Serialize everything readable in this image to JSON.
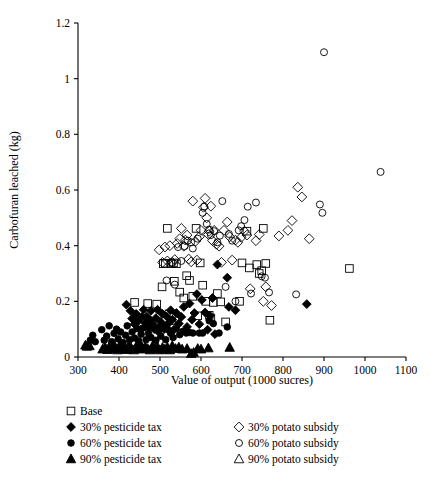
{
  "chart_data": {
    "type": "scatter",
    "title": "",
    "xlabel": "Value of output (1000 sucres)",
    "ylabel": "Carbofuran leached (kg)",
    "xlim": [
      300,
      1100
    ],
    "ylim": [
      0,
      1.2
    ],
    "xticks": [
      300,
      400,
      500,
      600,
      700,
      800,
      900,
      1000,
      1100
    ],
    "yticks": [
      0,
      0.2,
      0.4,
      0.6,
      0.8,
      1,
      1.2
    ],
    "xtick_labels": [
      "300",
      "400",
      "500",
      "600",
      "700",
      "800",
      "900",
      "1000",
      "1100"
    ],
    "ytick_labels": [
      "0",
      "0.2",
      "0.4",
      "0.6",
      "0.8",
      "1",
      "1.2"
    ],
    "grid": false,
    "legend_position": "below-axes",
    "series": [
      {
        "name": "Base",
        "marker": "open-square",
        "filled": false,
        "color": "#000000",
        "points": [
          [
            438,
            0.196
          ],
          [
            470,
            0.192
          ],
          [
            492,
            0.19
          ],
          [
            505,
            0.252
          ],
          [
            508,
            0.335
          ],
          [
            513,
            0.337
          ],
          [
            518,
            0.462
          ],
          [
            527,
            0.335
          ],
          [
            522,
            0.155
          ],
          [
            528,
            0.13
          ],
          [
            533,
            0.338
          ],
          [
            535,
            0.272
          ],
          [
            540,
            0.335
          ],
          [
            548,
            0.233
          ],
          [
            558,
            0.212
          ],
          [
            565,
            0.292
          ],
          [
            572,
            0.275
          ],
          [
            580,
            0.218
          ],
          [
            588,
            0.462
          ],
          [
            592,
            0.148
          ],
          [
            598,
            0.338
          ],
          [
            604,
            0.258
          ],
          [
            612,
            0.2
          ],
          [
            620,
            0.15
          ],
          [
            624,
            0.14
          ],
          [
            630,
            0.196
          ],
          [
            640,
            0.228
          ],
          [
            648,
            0.198
          ],
          [
            660,
            0.126
          ],
          [
            694,
            0.2
          ],
          [
            700,
            0.338
          ],
          [
            712,
            0.452
          ],
          [
            718,
            0.32
          ],
          [
            736,
            0.332
          ],
          [
            742,
            0.3
          ],
          [
            748,
            0.31
          ],
          [
            752,
            0.462
          ],
          [
            758,
            0.336
          ],
          [
            768,
            0.132
          ],
          [
            962,
            0.318
          ]
        ]
      },
      {
        "name": "30% pesticide tax",
        "marker": "filled-diamond",
        "filled": true,
        "color": "#000000",
        "points": [
          [
            418,
            0.188
          ],
          [
            428,
            0.166
          ],
          [
            432,
            0.138
          ],
          [
            438,
            0.118
          ],
          [
            442,
            0.155
          ],
          [
            446,
            0.128
          ],
          [
            452,
            0.098
          ],
          [
            456,
            0.144
          ],
          [
            460,
            0.17
          ],
          [
            464,
            0.122
          ],
          [
            468,
            0.145
          ],
          [
            472,
            0.108
          ],
          [
            476,
            0.132
          ],
          [
            478,
            0.166
          ],
          [
            482,
            0.118
          ],
          [
            486,
            0.1
          ],
          [
            490,
            0.14
          ],
          [
            494,
            0.17
          ],
          [
            498,
            0.108
          ],
          [
            502,
            0.126
          ],
          [
            506,
            0.155
          ],
          [
            510,
            0.1
          ],
          [
            516,
            0.146
          ],
          [
            520,
            0.12
          ],
          [
            526,
            0.168
          ],
          [
            530,
            0.134
          ],
          [
            534,
            0.098
          ],
          [
            540,
            0.158
          ],
          [
            546,
            0.12
          ],
          [
            552,
            0.144
          ],
          [
            558,
            0.18
          ],
          [
            566,
            0.108
          ],
          [
            572,
            0.192
          ],
          [
            578,
            0.134
          ],
          [
            584,
            0.158
          ],
          [
            590,
            0.226
          ],
          [
            596,
            0.118
          ],
          [
            602,
            0.205
          ],
          [
            610,
            0.16
          ],
          [
            616,
            0.098
          ],
          [
            622,
            0.148
          ],
          [
            628,
            0.212
          ],
          [
            634,
            0.082
          ],
          [
            640,
            0.332
          ],
          [
            664,
            0.285
          ],
          [
            668,
            0.18
          ],
          [
            684,
            0.168
          ],
          [
            858,
            0.19
          ]
        ]
      },
      {
        "name": "60% pesticide tax",
        "marker": "filled-circle",
        "filled": true,
        "color": "#000000",
        "points": [
          [
            330,
            0.06
          ],
          [
            336,
            0.078
          ],
          [
            342,
            0.055
          ],
          [
            358,
            0.098
          ],
          [
            364,
            0.06
          ],
          [
            370,
            0.075
          ],
          [
            376,
            0.112
          ],
          [
            382,
            0.055
          ],
          [
            388,
            0.085
          ],
          [
            394,
            0.1
          ],
          [
            398,
            0.065
          ],
          [
            404,
            0.09
          ],
          [
            410,
            0.052
          ],
          [
            416,
            0.078
          ],
          [
            420,
            0.112
          ],
          [
            426,
            0.062
          ],
          [
            432,
            0.09
          ],
          [
            438,
            0.068
          ],
          [
            444,
            0.102
          ],
          [
            448,
            0.058
          ],
          [
            454,
            0.082
          ],
          [
            460,
            0.105
          ],
          [
            466,
            0.062
          ],
          [
            472,
            0.085
          ],
          [
            478,
            0.07
          ],
          [
            484,
            0.105
          ],
          [
            490,
            0.06
          ],
          [
            496,
            0.092
          ],
          [
            502,
            0.075
          ],
          [
            508,
            0.112
          ],
          [
            514,
            0.062
          ],
          [
            520,
            0.098
          ],
          [
            526,
            0.085
          ],
          [
            532,
            0.07
          ],
          [
            540,
            0.102
          ],
          [
            548,
            0.08
          ],
          [
            556,
            0.092
          ],
          [
            564,
            0.086
          ],
          [
            572,
            0.088
          ],
          [
            580,
            0.086
          ],
          [
            596,
            0.086
          ],
          [
            604,
            0.086
          ],
          [
            620,
            0.13
          ],
          [
            630,
            0.12
          ],
          [
            644,
            0.086
          ],
          [
            664,
            0.108
          ]
        ]
      },
      {
        "name": "90% pesticide tax",
        "marker": "filled-triangle",
        "filled": true,
        "color": "#000000",
        "points": [
          [
            318,
            0.042
          ],
          [
            322,
            0.038
          ],
          [
            328,
            0.04
          ],
          [
            360,
            0.028
          ],
          [
            366,
            0.035
          ],
          [
            372,
            0.026
          ],
          [
            378,
            0.04
          ],
          [
            384,
            0.03
          ],
          [
            390,
            0.038
          ],
          [
            396,
            0.025
          ],
          [
            402,
            0.042
          ],
          [
            408,
            0.03
          ],
          [
            412,
            0.038
          ],
          [
            418,
            0.026
          ],
          [
            424,
            0.04
          ],
          [
            430,
            0.032
          ],
          [
            436,
            0.025
          ],
          [
            442,
            0.038
          ],
          [
            448,
            0.03
          ],
          [
            454,
            0.042
          ],
          [
            458,
            0.028
          ],
          [
            464,
            0.036
          ],
          [
            470,
            0.03
          ],
          [
            476,
            0.025
          ],
          [
            482,
            0.04
          ],
          [
            488,
            0.03
          ],
          [
            494,
            0.036
          ],
          [
            500,
            0.025
          ],
          [
            506,
            0.034
          ],
          [
            512,
            0.028
          ],
          [
            518,
            0.035
          ],
          [
            524,
            0.025
          ],
          [
            530,
            0.04
          ],
          [
            538,
            0.03
          ],
          [
            546,
            0.035
          ],
          [
            554,
            0.028
          ],
          [
            566,
            0.03
          ],
          [
            576,
            0.012
          ],
          [
            582,
            0.016
          ],
          [
            592,
            0.03
          ],
          [
            600,
            0.028
          ],
          [
            618,
            0.032
          ],
          [
            670,
            0.034
          ]
        ]
      },
      {
        "name": "30% potato subsidy",
        "marker": "open-diamond",
        "filled": false,
        "color": "#000000",
        "points": [
          [
            498,
            0.385
          ],
          [
            506,
            0.34
          ],
          [
            512,
            0.395
          ],
          [
            518,
            0.345
          ],
          [
            524,
            0.4
          ],
          [
            530,
            0.34
          ],
          [
            536,
            0.35
          ],
          [
            542,
            0.408
          ],
          [
            548,
            0.425
          ],
          [
            552,
            0.462
          ],
          [
            558,
            0.398
          ],
          [
            562,
            0.42
          ],
          [
            566,
            0.438
          ],
          [
            570,
            0.352
          ],
          [
            576,
            0.342
          ],
          [
            580,
            0.56
          ],
          [
            586,
            0.415
          ],
          [
            590,
            0.348
          ],
          [
            596,
            0.432
          ],
          [
            600,
            0.455
          ],
          [
            606,
            0.538
          ],
          [
            610,
            0.57
          ],
          [
            614,
            0.5
          ],
          [
            618,
            0.44
          ],
          [
            620,
            0.452
          ],
          [
            624,
            0.542
          ],
          [
            628,
            0.418
          ],
          [
            632,
            0.455
          ],
          [
            638,
            0.405
          ],
          [
            644,
            0.398
          ],
          [
            650,
            0.34
          ],
          [
            656,
            0.455
          ],
          [
            664,
            0.485
          ],
          [
            670,
            0.432
          ],
          [
            676,
            0.348
          ],
          [
            684,
            0.42
          ],
          [
            690,
            0.412
          ],
          [
            698,
            0.43
          ],
          [
            706,
            0.452
          ],
          [
            712,
            0.438
          ],
          [
            720,
            0.245
          ],
          [
            734,
            0.418
          ],
          [
            742,
            0.44
          ],
          [
            752,
            0.2
          ],
          [
            758,
            0.252
          ],
          [
            772,
            0.185
          ],
          [
            790,
            0.435
          ],
          [
            812,
            0.455
          ],
          [
            822,
            0.49
          ],
          [
            836,
            0.61
          ],
          [
            846,
            0.575
          ],
          [
            864,
            0.425
          ]
        ]
      },
      {
        "name": "60% potato subsidy",
        "marker": "open-circle",
        "filled": false,
        "color": "#000000",
        "points": [
          [
            516,
            0.275
          ],
          [
            528,
            0.34
          ],
          [
            536,
            0.26
          ],
          [
            544,
            0.395
          ],
          [
            552,
            0.345
          ],
          [
            560,
            0.398
          ],
          [
            568,
            0.418
          ],
          [
            576,
            0.412
          ],
          [
            580,
            0.39
          ],
          [
            592,
            0.425
          ],
          [
            604,
            0.518
          ],
          [
            608,
            0.54
          ],
          [
            614,
            0.478
          ],
          [
            620,
            0.458
          ],
          [
            624,
            0.438
          ],
          [
            632,
            0.452
          ],
          [
            640,
            0.412
          ],
          [
            646,
            0.436
          ],
          [
            652,
            0.56
          ],
          [
            660,
            0.252
          ],
          [
            668,
            0.442
          ],
          [
            676,
            0.418
          ],
          [
            684,
            0.2
          ],
          [
            692,
            0.455
          ],
          [
            698,
            0.47
          ],
          [
            706,
            0.492
          ],
          [
            714,
            0.54
          ],
          [
            722,
            0.228
          ],
          [
            734,
            0.555
          ],
          [
            748,
            0.29
          ],
          [
            756,
            0.285
          ],
          [
            766,
            0.232
          ],
          [
            832,
            0.225
          ],
          [
            890,
            0.548
          ],
          [
            896,
            0.518
          ],
          [
            900,
            1.095
          ],
          [
            1038,
            0.665
          ]
        ]
      },
      {
        "name": "90% potato subsidy",
        "marker": "open-triangle",
        "filled": false,
        "color": "#000000",
        "points": []
      }
    ]
  },
  "legend": {
    "rows": [
      {
        "left": {
          "label": "Base",
          "marker": "open-square"
        },
        "right": null
      },
      {
        "left": {
          "label": "30% pesticide tax",
          "marker": "filled-diamond"
        },
        "right": {
          "label": "30% potato subsidy",
          "marker": "open-diamond"
        }
      },
      {
        "left": {
          "label": "60% pesticide tax",
          "marker": "filled-circle"
        },
        "right": {
          "label": "60% potato subsidy",
          "marker": "open-circle"
        }
      },
      {
        "left": {
          "label": "90% pesticide tax",
          "marker": "filled-triangle"
        },
        "right": {
          "label": "90% potato subsidy",
          "marker": "open-triangle"
        }
      }
    ]
  },
  "colors": {
    "axis": "#000000",
    "marker": "#000000",
    "background": "#ffffff"
  }
}
